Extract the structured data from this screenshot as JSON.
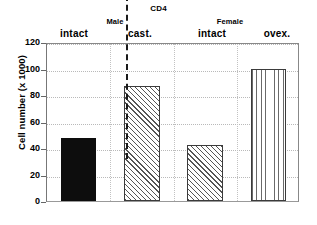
{
  "chart_data": {
    "type": "bar",
    "title": "CD4",
    "xlabel": "",
    "ylabel": "Cell number (x 1000)",
    "ylim": [
      0,
      120
    ],
    "yticks": [
      0,
      20,
      40,
      60,
      80,
      100,
      120
    ],
    "grid": true,
    "legend": null,
    "groups": [
      {
        "name": "Male",
        "categories": [
          "intact",
          "cast."
        ]
      },
      {
        "name": "Female",
        "categories": [
          "intact",
          "ovex."
        ]
      }
    ],
    "categories": [
      "intact",
      "cast.",
      "intact",
      "ovex."
    ],
    "values": [
      47.5,
      86.5,
      42.5,
      100
    ],
    "bar_styles": [
      "solid-black",
      "diagonal-hatch",
      "diagonal-hatch",
      "vertical-hatch"
    ],
    "annotations": [
      "dashed vertical divider between Male and Female groups"
    ]
  },
  "axis": {
    "y_title": "Cell number (x 1000)",
    "tick_labels": [
      "120",
      "100",
      "80",
      "60",
      "40",
      "20",
      "0"
    ]
  },
  "title": {
    "text": "CD4"
  },
  "groups": [
    {
      "label": "Male"
    },
    {
      "label": "Female"
    }
  ],
  "conditions": [
    {
      "label": "intact"
    },
    {
      "label": "cast."
    },
    {
      "label": "intact"
    },
    {
      "label": "ovex."
    }
  ]
}
